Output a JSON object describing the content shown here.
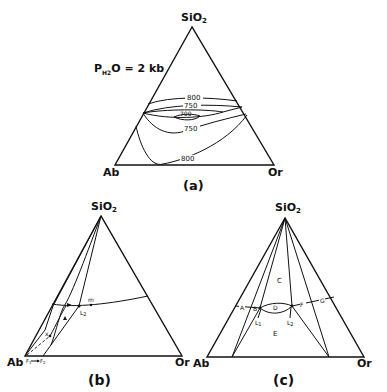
{
  "diagram_a": {
    "apex_label": "SiO",
    "apex_sub": "2",
    "left_label": "Ab",
    "right_label": "Or",
    "caption": "(a)",
    "pressure_label": "P",
    "pressure_sub": "H2",
    "pressure_rest": "O = 2 kb",
    "isotherms": [
      "800",
      "750",
      "700",
      "750",
      "800"
    ]
  },
  "diagram_b": {
    "apex_label": "SiO",
    "apex_sub": "2",
    "left_label": "Ab",
    "right_label": "Or",
    "caption": "(b)",
    "point_m": "m",
    "point_L2": "L",
    "point_L2_sub": "2",
    "point_x": "x",
    "point_F1": "F",
    "point_F1_sub": "1",
    "point_F2": "F",
    "point_F2_sub": "2"
  },
  "diagram_c": {
    "apex_label": "SiO",
    "apex_sub": "2",
    "left_label": "Ab",
    "right_label": "Or",
    "caption": "(c)",
    "points": [
      "A",
      "B",
      "D",
      "F",
      "G"
    ],
    "region_C": "C",
    "region_E": "E",
    "point_L1": "L",
    "point_L1_sub": "1",
    "point_L2": "L",
    "point_L2_sub": "2"
  }
}
